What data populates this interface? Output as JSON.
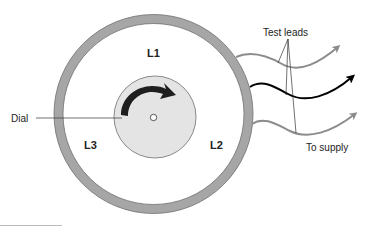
{
  "diagram": {
    "type": "phase-rotation-meter",
    "labels": {
      "l1": "L1",
      "l2": "L2",
      "l3": "L3",
      "dial": "Dial",
      "test_leads": "Test leads",
      "to_supply": "To supply"
    },
    "colors": {
      "ring": "#a6a6a6",
      "ring_stroke": "#6e6e6e",
      "dial_fill": "#e4e4e4",
      "dial_stroke": "#8a8a8a",
      "arrow": "#1e1e1e",
      "lead_gray": "#8c8c8c",
      "lead_black": "#000000",
      "text": "#222222"
    },
    "leads": [
      {
        "name": "lead-top",
        "color": "gray"
      },
      {
        "name": "lead-middle",
        "color": "black"
      },
      {
        "name": "lead-bottom",
        "color": "gray"
      }
    ]
  }
}
